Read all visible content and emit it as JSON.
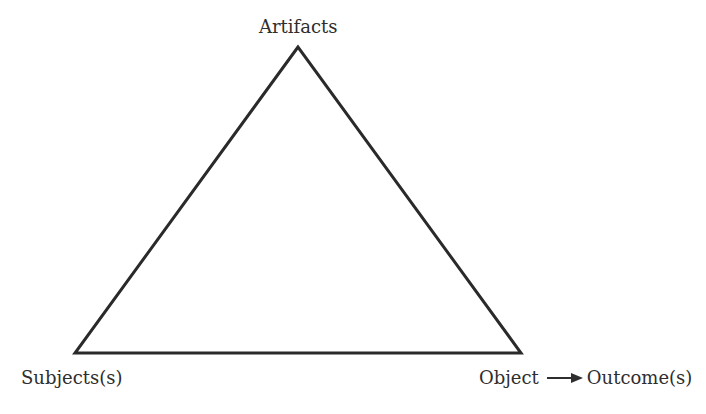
{
  "diagram": {
    "type": "activity-theory-triangle",
    "nodes": {
      "top": {
        "label": "Artifacts"
      },
      "bottom_left": {
        "label": "Subjects(s)"
      },
      "bottom_right": {
        "label": "Object",
        "arrow_target": "Outcome(s)"
      }
    },
    "edges": [
      {
        "from": "top",
        "to": "bottom_left"
      },
      {
        "from": "bottom_left",
        "to": "bottom_right"
      },
      {
        "from": "bottom_right",
        "to": "top"
      }
    ],
    "colors": {
      "stroke": "#2a2a2a",
      "text": "#2e2e2e",
      "background": "#ffffff"
    },
    "icons": {
      "arrow": "right-arrow-icon"
    }
  }
}
